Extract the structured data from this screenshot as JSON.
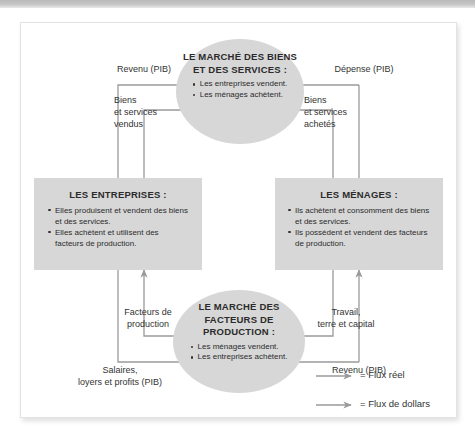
{
  "diagram": {
    "title_hidden": "Le flux circulaire de l'economie",
    "nodes": {
      "market_goods": {
        "title": "LE MARCHÉ\nDES BIENS ET\nDES SERVICES :",
        "bullets": [
          "Les entreprises vendent.",
          "Les ménages achètent."
        ]
      },
      "firms": {
        "title": "LES ENTREPRISES :",
        "bullets": [
          "Elles produisent et vendent des biens et des services.",
          "Elles achètent et utilisent des facteurs de production."
        ]
      },
      "households": {
        "title": "LES MÉNAGES :",
        "bullets": [
          "Ils achètent et consomment des biens et des services.",
          "Ils possèdent et vendent des facteurs de production."
        ]
      },
      "market_factors": {
        "title": "LE MARCHÉ\nDES FACTEURS\nDE PRODUCTION :",
        "bullets": [
          "Les ménages vendent.",
          "Les entreprises achètent."
        ]
      }
    },
    "flow_labels": {
      "revenu_top": "Revenu (PIB)",
      "depense_top": "Dépense (PIB)",
      "biens_vendus": "Biens\net services\nvendus",
      "biens_achetes": "Biens\net services\nachetés",
      "facteurs_production": "Facteurs de\nproduction",
      "travail_terre_capital": "Travail,\nterre et capital",
      "salaires_loyers": "Salaires,\nloyers et profits (PIB)",
      "revenu_bottom": "Revenu (PIB)"
    },
    "legend": [
      {
        "symbol": "arrow-right",
        "equals": "=",
        "label": "Flux réel"
      },
      {
        "symbol": "arrow-right",
        "equals": "=",
        "label": "Flux de dollars"
      }
    ],
    "colors": {
      "shape_fill": "#d7d7d7",
      "line": "#9a9a9a",
      "text": "#2b2b2b",
      "card_bg": "#ffffff",
      "top_band": "#c0c0c0"
    }
  }
}
